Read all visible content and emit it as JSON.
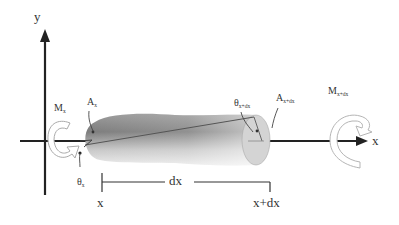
{
  "diagram": {
    "axes": {
      "y_label": "y",
      "x_label": "x"
    },
    "left_end": {
      "moment_label": "M",
      "moment_sub": "x",
      "area_label": "A",
      "area_sub": "x",
      "angle_label": "θ",
      "angle_sub": "x"
    },
    "right_end": {
      "moment_label": "M",
      "moment_sub": "x+dx",
      "area_label": "A",
      "area_sub": "x+dx",
      "angle_label": "θ",
      "angle_sub": "x+dx"
    },
    "dimension": {
      "start_label": "x",
      "length_label": "dx",
      "end_label": "x+dx"
    },
    "colors": {
      "axis": "#222222",
      "bar_dark": "#6a6a6a",
      "bar_light": "#e6e6e6",
      "end_face": "#d0d0d0",
      "moment_arrow": "#ffffff",
      "moment_outline": "#b0b0b0"
    }
  }
}
